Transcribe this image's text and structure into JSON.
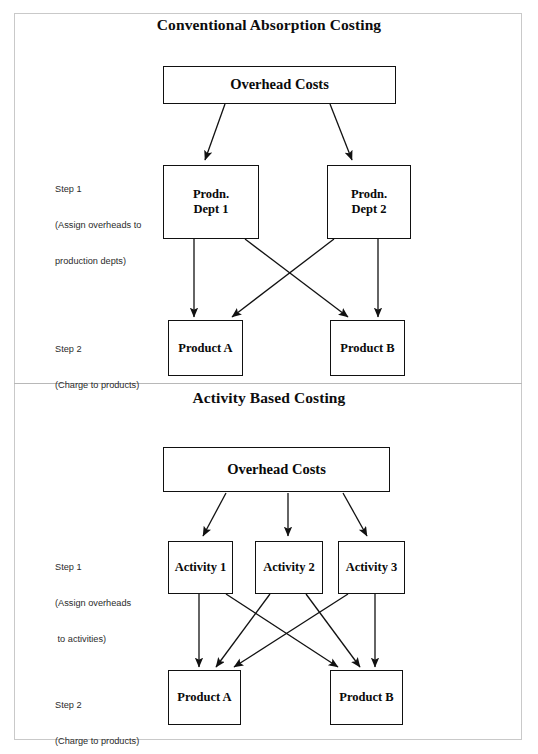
{
  "figure": {
    "panels": [
      {
        "id": "conventional",
        "title": "Conventional Absorption Costing",
        "steps": [
          {
            "id": "step1",
            "line1": "Step 1",
            "line2": "(Assign overheads to",
            "line3": "production depts)"
          },
          {
            "id": "step2",
            "line1": "Step 2",
            "line2": "(Charge to products)",
            "line3": ""
          }
        ],
        "nodes": [
          {
            "id": "overhead-costs",
            "label": "Overhead Costs"
          },
          {
            "id": "prodn-dept-1",
            "label_line1": "Prodn.",
            "label_line2": "Dept 1"
          },
          {
            "id": "prodn-dept-2",
            "label_line1": "Prodn.",
            "label_line2": "Dept 2"
          },
          {
            "id": "product-a",
            "label": "Product A"
          },
          {
            "id": "product-b",
            "label": "Product B"
          }
        ]
      },
      {
        "id": "activity-based",
        "title": "Activity Based Costing",
        "steps": [
          {
            "id": "step1",
            "line1": "Step 1",
            "line2": "(Assign overheads",
            "line3": " to activities)"
          },
          {
            "id": "step2",
            "line1": "Step 2",
            "line2": "(Charge to products)",
            "line3": ""
          }
        ],
        "nodes": [
          {
            "id": "overhead-costs",
            "label": "Overhead Costs"
          },
          {
            "id": "activity-1",
            "label": "Activity 1"
          },
          {
            "id": "activity-2",
            "label": "Activity 2"
          },
          {
            "id": "activity-3",
            "label": "Activity 3"
          },
          {
            "id": "product-a",
            "label": "Product A"
          },
          {
            "id": "product-b",
            "label": "Product B"
          }
        ]
      }
    ],
    "colors": {
      "box_border": "#111111",
      "frame_border": "#c9c9c9",
      "text": "#0a0a0a",
      "step_text": "#2b2b2b",
      "background": "#ffffff"
    }
  }
}
